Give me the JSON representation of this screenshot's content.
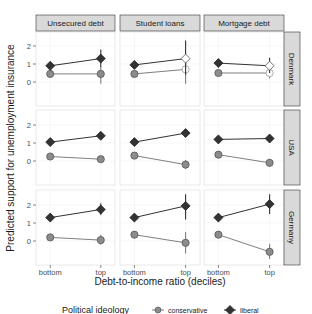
{
  "chart_data": {
    "type": "line",
    "title": "",
    "xlabel": "Debt-to-income ratio (deciles)",
    "ylabel": "Predicted support for unemployment insurance",
    "x_categories": [
      "bottom",
      "top"
    ],
    "y_ticks": [
      0,
      1,
      2
    ],
    "ylim": [
      -1.2,
      2.6
    ],
    "grid": true,
    "columns": [
      "Unsecured debt",
      "Student loans",
      "Mortgage debt"
    ],
    "rows": [
      "Denmark",
      "USA",
      "Germany"
    ],
    "legend": {
      "title": "Political ideology",
      "position": "bottom",
      "entries": [
        {
          "name": "conservative",
          "shape": "circle",
          "color": "#7f7f7f"
        },
        {
          "name": "liberal",
          "shape": "diamond",
          "color": "#333333"
        }
      ]
    },
    "panels": [
      {
        "row": "Denmark",
        "col": "Unsecured debt",
        "series": [
          {
            "name": "conservative",
            "values": [
              0.45,
              0.45
            ],
            "ci": [
              [
                0.35,
                0.55
              ],
              [
                -0.1,
                0.8
              ]
            ],
            "hollow": [
              false,
              false
            ]
          },
          {
            "name": "liberal",
            "values": [
              0.9,
              1.3
            ],
            "ci": [
              [
                0.75,
                1.05
              ],
              [
                0.8,
                1.8
              ]
            ],
            "hollow": [
              false,
              false
            ]
          }
        ]
      },
      {
        "row": "Denmark",
        "col": "Student loans",
        "series": [
          {
            "name": "conservative",
            "values": [
              0.45,
              0.7
            ],
            "ci": [
              [
                0.35,
                0.55
              ],
              [
                -0.1,
                1.2
              ]
            ],
            "hollow": [
              false,
              true
            ]
          },
          {
            "name": "liberal",
            "values": [
              0.95,
              1.3
            ],
            "ci": [
              [
                0.8,
                1.1
              ],
              [
                0.4,
                2.3
              ]
            ],
            "hollow": [
              false,
              true
            ]
          }
        ]
      },
      {
        "row": "Denmark",
        "col": "Mortgage debt",
        "series": [
          {
            "name": "conservative",
            "values": [
              0.5,
              0.5
            ],
            "ci": [
              [
                0.4,
                0.6
              ],
              [
                0.2,
                0.8
              ]
            ],
            "hollow": [
              false,
              true
            ]
          },
          {
            "name": "liberal",
            "values": [
              1.05,
              0.9
            ],
            "ci": [
              [
                0.9,
                1.2
              ],
              [
                0.5,
                1.35
              ]
            ],
            "hollow": [
              false,
              true
            ]
          }
        ]
      },
      {
        "row": "USA",
        "col": "Unsecured debt",
        "series": [
          {
            "name": "conservative",
            "values": [
              0.25,
              0.1
            ],
            "ci": [
              [
                0.15,
                0.35
              ],
              [
                0.0,
                0.2
              ]
            ],
            "hollow": [
              false,
              false
            ]
          },
          {
            "name": "liberal",
            "values": [
              1.05,
              1.4
            ],
            "ci": [
              [
                0.95,
                1.15
              ],
              [
                1.3,
                1.5
              ]
            ],
            "hollow": [
              false,
              false
            ]
          }
        ]
      },
      {
        "row": "USA",
        "col": "Student loans",
        "series": [
          {
            "name": "conservative",
            "values": [
              0.3,
              -0.2
            ],
            "ci": [
              [
                0.2,
                0.4
              ],
              [
                -0.45,
                0.05
              ]
            ],
            "hollow": [
              false,
              false
            ]
          },
          {
            "name": "liberal",
            "values": [
              1.05,
              1.55
            ],
            "ci": [
              [
                0.95,
                1.15
              ],
              [
                1.35,
                1.75
              ]
            ],
            "hollow": [
              false,
              false
            ]
          }
        ]
      },
      {
        "row": "USA",
        "col": "Mortgage debt",
        "series": [
          {
            "name": "conservative",
            "values": [
              0.35,
              -0.1
            ],
            "ci": [
              [
                0.25,
                0.45
              ],
              [
                -0.3,
                0.1
              ]
            ],
            "hollow": [
              false,
              false
            ]
          },
          {
            "name": "liberal",
            "values": [
              1.2,
              1.25
            ],
            "ci": [
              [
                1.1,
                1.3
              ],
              [
                1.15,
                1.35
              ]
            ],
            "hollow": [
              false,
              false
            ]
          }
        ]
      },
      {
        "row": "Germany",
        "col": "Unsecured debt",
        "series": [
          {
            "name": "conservative",
            "values": [
              0.2,
              0.05
            ],
            "ci": [
              [
                0.1,
                0.3
              ],
              [
                -0.2,
                0.35
              ]
            ],
            "hollow": [
              false,
              false
            ]
          },
          {
            "name": "liberal",
            "values": [
              1.3,
              1.75
            ],
            "ci": [
              [
                1.2,
                1.4
              ],
              [
                1.45,
                2.1
              ]
            ],
            "hollow": [
              false,
              false
            ]
          }
        ]
      },
      {
        "row": "Germany",
        "col": "Student loans",
        "series": [
          {
            "name": "conservative",
            "values": [
              0.35,
              -0.1
            ],
            "ci": [
              [
                0.25,
                0.45
              ],
              [
                -0.7,
                0.5
              ]
            ],
            "hollow": [
              false,
              false
            ]
          },
          {
            "name": "liberal",
            "values": [
              1.3,
              1.95
            ],
            "ci": [
              [
                1.2,
                1.4
              ],
              [
                1.2,
                2.6
              ]
            ],
            "hollow": [
              false,
              false
            ]
          }
        ]
      },
      {
        "row": "Germany",
        "col": "Mortgage debt",
        "series": [
          {
            "name": "conservative",
            "values": [
              0.35,
              -0.6
            ],
            "ci": [
              [
                0.25,
                0.45
              ],
              [
                -1.0,
                -0.15
              ]
            ],
            "hollow": [
              false,
              false
            ]
          },
          {
            "name": "liberal",
            "values": [
              1.3,
              2.05
            ],
            "ci": [
              [
                1.2,
                1.4
              ],
              [
                1.5,
                2.6
              ]
            ],
            "hollow": [
              false,
              false
            ]
          }
        ]
      }
    ]
  }
}
